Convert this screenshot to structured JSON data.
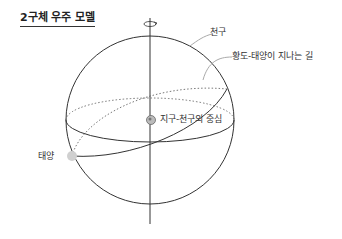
{
  "title": "2구체 우주 모델",
  "labels": {
    "celestial_sphere": "천구",
    "ecliptic": "황도-태양이 지나는 길",
    "center": "지구-천구의 중심",
    "sun": "태양"
  },
  "colors": {
    "line": "#333333",
    "sun": "#d0d0d0",
    "earth": "#888888"
  }
}
